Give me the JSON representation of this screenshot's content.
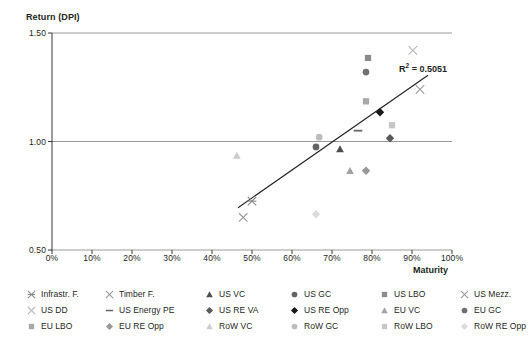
{
  "chart_data": {
    "type": "scatter",
    "title": "",
    "ylabel": "Return (DPI)",
    "xlabel": "Maturity",
    "xlim": [
      0,
      100
    ],
    "ylim": [
      0.5,
      1.5
    ],
    "xticks": [
      "0%",
      "10%",
      "20%",
      "30%",
      "40%",
      "50%",
      "60%",
      "70%",
      "80%",
      "90%",
      "100%"
    ],
    "xtick_values": [
      0,
      10,
      20,
      30,
      40,
      50,
      60,
      70,
      80,
      90,
      100
    ],
    "yticks": [
      "0.50",
      "1.00",
      "1.50"
    ],
    "ytick_values": [
      0.5,
      1.0,
      1.5
    ],
    "grid": "horizontal",
    "legend_position": "bottom",
    "annotations": [
      {
        "text": "R² = 0.5051",
        "x": 87,
        "y": 1.365
      }
    ],
    "trendline": {
      "x0": 46.5,
      "y0": 0.695,
      "x1": 94.0,
      "y1": 1.305
    },
    "series": [
      {
        "name": "Infrastr. F.",
        "marker": "asterisk",
        "color": "#8a8a8a",
        "x": 50.0,
        "y": 0.725
      },
      {
        "name": "Timber F.",
        "marker": "x",
        "color": "#9a9a9a",
        "x": 47.8,
        "y": 0.65
      },
      {
        "name": "US VC",
        "marker": "triangle",
        "color": "#4d4d4d",
        "x": 72.0,
        "y": 0.965
      },
      {
        "name": "US GC",
        "marker": "circle",
        "color": "#636363",
        "x": 66.0,
        "y": 0.975
      },
      {
        "name": "US LBO",
        "marker": "square",
        "color": "#8c8c8c",
        "x": 79.0,
        "y": 1.385
      },
      {
        "name": "US Mezz.",
        "marker": "x",
        "color": "#9a9a9a",
        "x": 92.0,
        "y": 1.24
      },
      {
        "name": "US DD",
        "marker": "x",
        "color": "#b5b5b5",
        "x": 90.2,
        "y": 1.42
      },
      {
        "name": "US Energy PE",
        "marker": "dash",
        "color": "#666666",
        "x": 76.5,
        "y": 1.05
      },
      {
        "name": "US RE VA",
        "marker": "diamond",
        "color": "#5a5a5a",
        "x": 84.5,
        "y": 1.015
      },
      {
        "name": "US RE Opp",
        "marker": "diamond",
        "color": "#1a1a1a",
        "x": 82.0,
        "y": 1.135
      },
      {
        "name": "EU VC",
        "marker": "triangle",
        "color": "#a3a3a3",
        "x": 74.5,
        "y": 0.865
      },
      {
        "name": "EU GC",
        "marker": "circle",
        "color": "#707070",
        "x": 78.5,
        "y": 1.32
      },
      {
        "name": "EU LBO",
        "marker": "square",
        "color": "#a8a8a8",
        "x": 78.5,
        "y": 1.185
      },
      {
        "name": "EU RE Opp",
        "marker": "diamond",
        "color": "#999999",
        "x": 78.5,
        "y": 0.865
      },
      {
        "name": "RoW VC",
        "marker": "triangle",
        "color": "#cccccc",
        "x": 46.2,
        "y": 0.935
      },
      {
        "name": "RoW GC",
        "marker": "circle",
        "color": "#bdbdbd",
        "x": 66.8,
        "y": 1.02
      },
      {
        "name": "RoW LBO",
        "marker": "square",
        "color": "#c7c7c7",
        "x": 85.0,
        "y": 1.075
      },
      {
        "name": "RoW RE Opp",
        "marker": "diamond",
        "color": "#dcdcdc",
        "x": 66.0,
        "y": 0.665
      }
    ]
  },
  "axis": {
    "y_title": "Return (DPI)",
    "x_title": "Maturity"
  },
  "annotation": {
    "r2_prefix": "R",
    "r2_exp": "2",
    "r2_value": " = 0.5051"
  },
  "legend": {
    "items": [
      {
        "label": "Infrastr. F."
      },
      {
        "label": "Timber F."
      },
      {
        "label": "US VC"
      },
      {
        "label": "US GC"
      },
      {
        "label": "US LBO"
      },
      {
        "label": "US Mezz."
      },
      {
        "label": "US DD"
      },
      {
        "label": "US Energy PE"
      },
      {
        "label": "US RE VA"
      },
      {
        "label": "US RE Opp"
      },
      {
        "label": "EU VC"
      },
      {
        "label": "EU GC"
      },
      {
        "label": "EU LBO"
      },
      {
        "label": "EU RE Opp"
      },
      {
        "label": "RoW VC"
      },
      {
        "label": "RoW GC"
      },
      {
        "label": "RoW LBO"
      },
      {
        "label": "RoW RE Opp"
      }
    ]
  },
  "colors": {
    "axis": "#231f20",
    "gridline": "#808080",
    "trendline": "#231f20",
    "background": "#ffffff"
  }
}
